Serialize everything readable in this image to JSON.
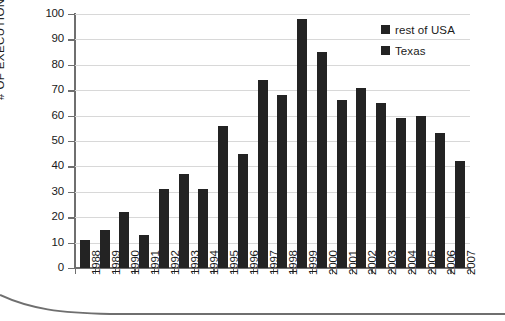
{
  "chart_data": {
    "type": "bar",
    "title": "",
    "xlabel": "",
    "ylabel": "# OF EXECUTIONS",
    "ylim": [
      0,
      100
    ],
    "ytick_step": 10,
    "grid": true,
    "legend_position": "top-right",
    "bar_color": "#232323",
    "categories": [
      "1988",
      "1989",
      "1990",
      "1991",
      "1992",
      "1993",
      "1994",
      "1995",
      "1996",
      "1997",
      "1998",
      "1999",
      "2000",
      "2001",
      "2002",
      "2003",
      "2004",
      "2005",
      "2006",
      "2007"
    ],
    "values": [
      11,
      15,
      22,
      13,
      31,
      37,
      31,
      56,
      45,
      74,
      68,
      98,
      85,
      66,
      71,
      65,
      59,
      60,
      53,
      42
    ],
    "yticks": [
      "0",
      "10",
      "20",
      "30",
      "40",
      "50",
      "60",
      "70",
      "80",
      "90",
      "100"
    ],
    "legend": [
      {
        "label": "rest of USA",
        "color": "#232323"
      },
      {
        "label": "Texas",
        "color": "#232323"
      }
    ]
  }
}
